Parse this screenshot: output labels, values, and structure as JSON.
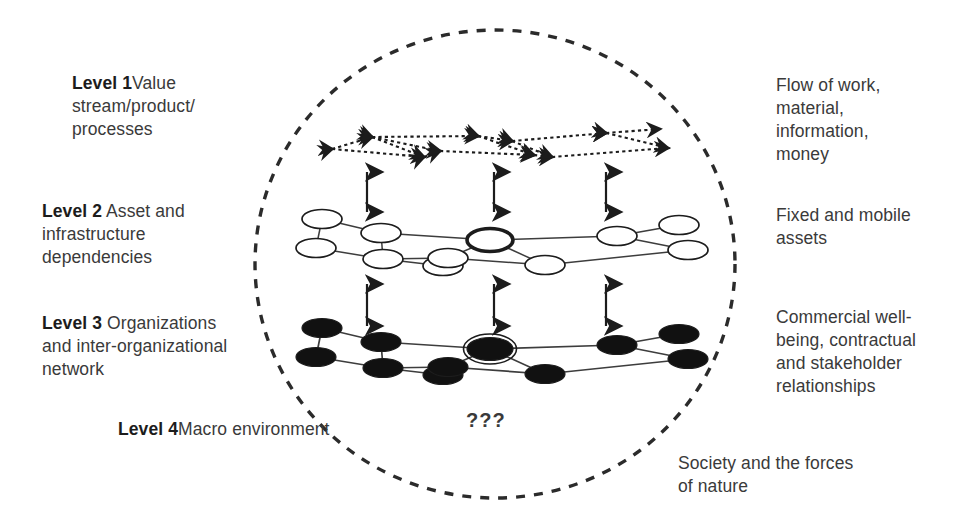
{
  "diagram": {
    "boundary": {
      "shape": "dashed-ellipse",
      "name": "system-boundary"
    },
    "unknown_marker": "???",
    "colors": {
      "ink": "#2b2b2b",
      "node_fill_hollow": "#ffffff",
      "node_fill_solid": "#111111",
      "line": "#4a4a4a",
      "boundary": "#2b2b2b"
    },
    "levels": [
      {
        "id": "level-1",
        "heading": "Level 1",
        "description": "Value stream/product/\nprocesses",
        "right_label": "Flow of work,\nmaterial,\ninformation,\nmoney",
        "layer_style": "dotted double-headed arrow network"
      },
      {
        "id": "level-2",
        "heading": "Level 2",
        "description": " Asset and\ninfrastructure\ndependencies",
        "right_label": "Fixed and mobile\nassets",
        "layer_style": "hollow ellipse network"
      },
      {
        "id": "level-3",
        "heading": "Level 3",
        "description": " Organizations\nand inter-organizational\nnetwork",
        "right_label": "Commercial well-\nbeing, contractual\nand stakeholder\nrelationships",
        "layer_style": "solid black ellipse network"
      },
      {
        "id": "level-4",
        "heading": "Level 4",
        "description": "Macro environment",
        "right_label": "Society and the forces\nof nature",
        "layer_style": "boundary region"
      }
    ],
    "coupling_arrows": {
      "name": "bidirectional-coupling-arrows",
      "count": 6,
      "columns_x": [
        367,
        494,
        606
      ],
      "between_1_and_2": {
        "y_top": 172,
        "y_bottom": 212
      },
      "between_2_and_3": {
        "y_top": 284,
        "y_bottom": 326
      }
    },
    "layer1_nodes": [
      {
        "x": 332,
        "y": 149
      },
      {
        "x": 372,
        "y": 137
      },
      {
        "x": 424,
        "y": 157
      },
      {
        "x": 440,
        "y": 151
      },
      {
        "x": 478,
        "y": 136
      },
      {
        "x": 512,
        "y": 141
      },
      {
        "x": 534,
        "y": 155
      },
      {
        "x": 552,
        "y": 157
      },
      {
        "x": 606,
        "y": 133
      },
      {
        "x": 660,
        "y": 129
      },
      {
        "x": 668,
        "y": 148
      }
    ],
    "layer1_edges": [
      [
        332,
        149,
        372,
        137
      ],
      [
        372,
        137,
        478,
        136
      ],
      [
        478,
        136,
        512,
        141
      ],
      [
        512,
        141,
        606,
        133
      ],
      [
        606,
        133,
        660,
        129
      ],
      [
        332,
        149,
        424,
        157
      ],
      [
        424,
        157,
        440,
        151
      ],
      [
        440,
        151,
        534,
        155
      ],
      [
        534,
        155,
        552,
        157
      ],
      [
        552,
        157,
        668,
        148
      ],
      [
        372,
        137,
        424,
        157
      ],
      [
        478,
        136,
        534,
        155
      ],
      [
        512,
        141,
        552,
        157
      ],
      [
        606,
        133,
        668,
        148
      ],
      [
        372,
        137,
        440,
        151
      ]
    ],
    "layer2_nodes": [
      {
        "x": 322,
        "y": 219,
        "style": "hollow"
      },
      {
        "x": 316,
        "y": 248,
        "style": "hollow"
      },
      {
        "x": 381,
        "y": 233,
        "style": "hollow"
      },
      {
        "x": 383,
        "y": 259,
        "style": "hollow"
      },
      {
        "x": 443,
        "y": 266,
        "style": "hollow"
      },
      {
        "x": 448,
        "y": 258,
        "style": "hollow"
      },
      {
        "x": 490,
        "y": 240,
        "style": "hollow-thick"
      },
      {
        "x": 545,
        "y": 265,
        "style": "hollow"
      },
      {
        "x": 617,
        "y": 236,
        "style": "hollow"
      },
      {
        "x": 679,
        "y": 225,
        "style": "hollow"
      },
      {
        "x": 688,
        "y": 250,
        "style": "hollow"
      }
    ],
    "layer2_edges": [
      [
        322,
        219,
        381,
        233
      ],
      [
        316,
        248,
        383,
        259
      ],
      [
        322,
        219,
        316,
        248
      ],
      [
        381,
        233,
        490,
        240
      ],
      [
        381,
        233,
        383,
        259
      ],
      [
        383,
        259,
        443,
        266
      ],
      [
        443,
        266,
        448,
        258
      ],
      [
        448,
        258,
        490,
        240
      ],
      [
        448,
        258,
        545,
        265
      ],
      [
        490,
        240,
        617,
        236
      ],
      [
        490,
        240,
        545,
        265
      ],
      [
        545,
        265,
        688,
        250
      ],
      [
        617,
        236,
        679,
        225
      ],
      [
        617,
        236,
        688,
        250
      ],
      [
        383,
        259,
        448,
        258
      ]
    ],
    "layer3_nodes": [
      {
        "x": 322,
        "y": 328,
        "style": "solid"
      },
      {
        "x": 316,
        "y": 357,
        "style": "solid"
      },
      {
        "x": 381,
        "y": 342,
        "style": "solid"
      },
      {
        "x": 383,
        "y": 368,
        "style": "solid"
      },
      {
        "x": 443,
        "y": 375,
        "style": "solid"
      },
      {
        "x": 448,
        "y": 367,
        "style": "solid"
      },
      {
        "x": 490,
        "y": 349,
        "style": "solid-ringed"
      },
      {
        "x": 545,
        "y": 374,
        "style": "solid"
      },
      {
        "x": 617,
        "y": 345,
        "style": "solid"
      },
      {
        "x": 679,
        "y": 334,
        "style": "solid"
      },
      {
        "x": 688,
        "y": 359,
        "style": "solid"
      }
    ],
    "layer3_edges": [
      [
        322,
        328,
        381,
        342
      ],
      [
        316,
        357,
        383,
        368
      ],
      [
        322,
        328,
        316,
        357
      ],
      [
        381,
        342,
        490,
        349
      ],
      [
        381,
        342,
        383,
        368
      ],
      [
        383,
        368,
        443,
        375
      ],
      [
        443,
        375,
        448,
        367
      ],
      [
        448,
        367,
        490,
        349
      ],
      [
        448,
        367,
        545,
        374
      ],
      [
        490,
        349,
        617,
        345
      ],
      [
        490,
        349,
        545,
        374
      ],
      [
        545,
        374,
        688,
        359
      ],
      [
        617,
        345,
        679,
        334
      ],
      [
        617,
        345,
        688,
        359
      ],
      [
        383,
        368,
        448,
        367
      ]
    ]
  }
}
